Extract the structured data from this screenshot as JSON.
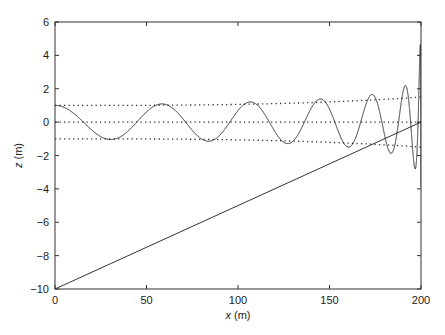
{
  "chart_data": {
    "type": "line",
    "title": "",
    "xlabel_var": "x",
    "xlabel_unit": " (m)",
    "ylabel_var": "z",
    "ylabel_unit": " (m)",
    "xlim": [
      0,
      200
    ],
    "ylim": [
      -10,
      6
    ],
    "xticks": [
      0,
      50,
      100,
      150,
      200
    ],
    "yticks": [
      6,
      4,
      2,
      0,
      -2,
      -4,
      -6,
      -8,
      -10
    ],
    "grid": false,
    "legend": null,
    "series": [
      {
        "name": "wave (solid)",
        "style": "solid",
        "description": "Oscillation with increasing frequency and growing amplitude toward x=200",
        "amplitude_at_x0": 1.0,
        "extrema_x": [
          0,
          33,
          62,
          85,
          105,
          120,
          134,
          145,
          155,
          163,
          170,
          176,
          181,
          185,
          189,
          192,
          195,
          197,
          199
        ],
        "extrema_z": [
          1,
          -1,
          1,
          -1,
          1.05,
          -1.05,
          1.1,
          -1.15,
          1.2,
          -1.2,
          1.25,
          -1.3,
          1.35,
          -1.4,
          1.5,
          -1.6,
          2,
          -2.5,
          4
        ]
      },
      {
        "name": "upper envelope (dotted)",
        "style": "dotted",
        "x": [
          0,
          50,
          100,
          150,
          200
        ],
        "z": [
          1.0,
          1.02,
          1.07,
          1.15,
          1.5
        ]
      },
      {
        "name": "centerline (dotted)",
        "style": "dotted",
        "x": [
          0,
          200
        ],
        "z": [
          0,
          0
        ]
      },
      {
        "name": "lower envelope (dotted)",
        "style": "dotted",
        "x": [
          0,
          50,
          100,
          150,
          200
        ],
        "z": [
          -1.0,
          -1.02,
          -1.07,
          -1.15,
          -1.5
        ]
      },
      {
        "name": "sloping bottom (solid)",
        "style": "solid",
        "x": [
          0,
          200
        ],
        "z": [
          -10,
          0
        ]
      }
    ]
  }
}
